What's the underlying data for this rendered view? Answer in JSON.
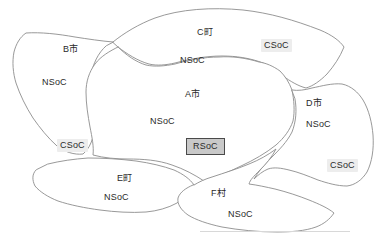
{
  "figure": {
    "background_color": "#ffffff",
    "boundary_color": "#8d8d8d",
    "csoc_highlight_color": "#ededed",
    "rsoc_fill_color": "#c9c9c9",
    "rsoc_border_color": "#4a4a4a",
    "text_color": "#2a2a2a"
  },
  "regions": [
    {
      "id": "region-a",
      "name": "A市",
      "name_x": 185,
      "name_y": 90,
      "soc": "NSoC",
      "soc_x": 150,
      "soc_y": 117,
      "markers": [
        {
          "type": "RSoC",
          "label": "RSoC",
          "x": 186,
          "y": 138
        }
      ]
    },
    {
      "id": "region-b",
      "name": "B市",
      "name_x": 63,
      "name_y": 45,
      "soc": "NSoC",
      "soc_x": 42,
      "soc_y": 78,
      "markers": [
        {
          "type": "CSoC",
          "label": "CSoC",
          "x": 57,
          "y": 139
        }
      ]
    },
    {
      "id": "region-c",
      "name": "C町",
      "name_x": 197,
      "name_y": 28,
      "soc": "NSoC",
      "soc_x": 180,
      "soc_y": 56,
      "markers": [
        {
          "type": "CSoC",
          "label": "CSoC",
          "x": 261,
          "y": 39
        }
      ]
    },
    {
      "id": "region-d",
      "name": "D市",
      "name_x": 306,
      "name_y": 99,
      "soc": "NSoC",
      "soc_x": 306,
      "soc_y": 120,
      "markers": [
        {
          "type": "CSoC",
          "label": "CSoC",
          "x": 327,
          "y": 159
        }
      ]
    },
    {
      "id": "region-e",
      "name": "E町",
      "name_x": 117,
      "name_y": 174,
      "soc": "NSoC",
      "soc_x": 104,
      "soc_y": 193,
      "markers": []
    },
    {
      "id": "region-f",
      "name": "F村",
      "name_x": 211,
      "name_y": 189,
      "soc": "NSoC",
      "soc_x": 228,
      "soc_y": 210,
      "markers": []
    }
  ],
  "legend_terms": {
    "nsoc": "NSoC",
    "csoc": "CSoC",
    "rsoc": "RSoC"
  }
}
